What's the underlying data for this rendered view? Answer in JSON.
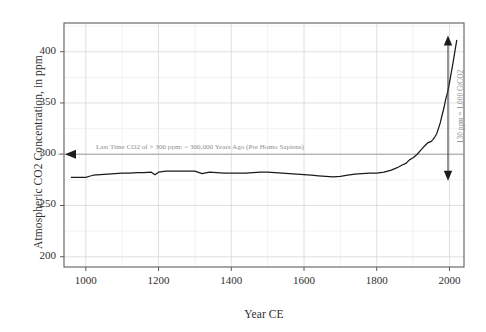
{
  "chart_data": {
    "type": "line",
    "title": "",
    "xlabel": "Year CE",
    "ylabel": "Atmospheric CO2 Concentration, in ppm",
    "xlim": [
      940,
      2040
    ],
    "ylim": [
      190,
      428
    ],
    "xticks": [
      1000,
      1200,
      1400,
      1600,
      1800,
      2000
    ],
    "yticks": [
      200,
      250,
      300,
      350,
      400
    ],
    "xtick_labels": [
      "1000",
      "1200",
      "1400",
      "1600",
      "1800",
      "2000"
    ],
    "ytick_labels": [
      "200",
      "250",
      "300",
      "350",
      "400"
    ],
    "grid": true,
    "minor_grid": true,
    "legend": "none",
    "series": [
      {
        "name": "Atmospheric CO2",
        "color": "#1a1a1a",
        "x": [
          960,
          980,
          1000,
          1010,
          1020,
          1040,
          1060,
          1080,
          1100,
          1120,
          1140,
          1160,
          1180,
          1190,
          1200,
          1210,
          1220,
          1240,
          1260,
          1280,
          1300,
          1320,
          1340,
          1360,
          1380,
          1400,
          1420,
          1440,
          1460,
          1480,
          1500,
          1520,
          1540,
          1560,
          1580,
          1600,
          1620,
          1640,
          1660,
          1680,
          1700,
          1720,
          1740,
          1760,
          1780,
          1800,
          1820,
          1840,
          1850,
          1860,
          1870,
          1880,
          1890,
          1900,
          1910,
          1920,
          1930,
          1940,
          1950,
          1955,
          1960,
          1965,
          1970,
          1975,
          1980,
          1985,
          1990,
          1995,
          2000,
          2005,
          2010,
          2015,
          2020
        ],
        "y": [
          277.5,
          277.5,
          277.5,
          278.5,
          279.5,
          280.0,
          280.5,
          281.0,
          281.5,
          281.5,
          282.0,
          282.0,
          282.5,
          280.0,
          282.5,
          283.0,
          283.5,
          283.5,
          283.5,
          283.5,
          283.5,
          281.0,
          282.5,
          282.0,
          281.5,
          281.5,
          281.5,
          281.5,
          282.0,
          282.5,
          282.5,
          282.0,
          281.5,
          281.0,
          280.5,
          280.0,
          279.5,
          279.0,
          278.5,
          278.0,
          278.5,
          279.5,
          280.5,
          281.0,
          281.5,
          281.5,
          282.5,
          284.5,
          286.0,
          287.5,
          289.5,
          291.0,
          294.5,
          296.5,
          299.5,
          303.5,
          307.5,
          311.0,
          312.5,
          314.5,
          317.0,
          320.0,
          325.5,
          331.0,
          338.5,
          345.5,
          354.0,
          360.5,
          369.5,
          379.5,
          389.5,
          400.5,
          411.0
        ]
      }
    ],
    "annotations": {
      "threshold_line": {
        "label": "Last Time CO2 of > 300 ppm: ~ 300,000 Years Ago (Pre Homo Sapiens)",
        "value_ppm": 300,
        "marker": "left-arrow",
        "color": "#9a9a9a"
      },
      "range_arrow": {
        "label": "130 ppm = 1,000 GtCO2",
        "from_ppm": 280,
        "to_ppm": 410,
        "marker": "double-arrow",
        "color": "#4a4a4a"
      }
    }
  },
  "axes": {
    "x_title": "Year CE",
    "y_title": "Atmospheric CO2 Concentration, in ppm"
  }
}
